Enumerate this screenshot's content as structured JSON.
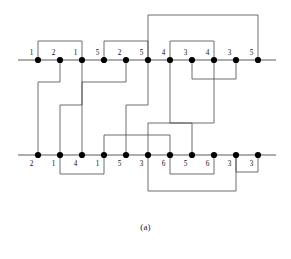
{
  "figure": {
    "caption": "(a)",
    "colors": {
      "axis_line": "#5b5b5b",
      "edge_line": "#4a4a4a",
      "node_fill": "#000000",
      "label_text": "#111111",
      "background": "#ffffff"
    },
    "geometry": {
      "node_spacing": 22,
      "first_node_x": 38,
      "top_row_y": 60,
      "bottom_row_y": 155,
      "node_radius": 3.1,
      "axis_left_x": 18,
      "axis_right_x": 276
    }
  },
  "chart_data": {
    "type": "diagram",
    "title": "(a)",
    "rows": [
      {
        "id": "top-row",
        "name": "top-strand",
        "y": 60,
        "label_position": "above",
        "labels": [
          "1",
          "2",
          "1",
          "5",
          "2",
          "5",
          "4",
          "3",
          "4",
          "3",
          "5"
        ],
        "x": [
          38,
          60,
          82,
          104,
          126,
          148,
          170,
          192,
          214,
          236,
          258
        ]
      },
      {
        "id": "bottom-row",
        "name": "bottom-strand",
        "y": 155,
        "label_position": "below",
        "labels": [
          "2",
          "1",
          "4",
          "1",
          "5",
          "3",
          "6",
          "5",
          "6",
          "3",
          "3"
        ],
        "x": [
          38,
          60,
          82,
          104,
          126,
          148,
          170,
          192,
          214,
          236,
          258
        ]
      }
    ],
    "edges": [
      {
        "id": "e1",
        "name": "top-arc-1-3",
        "kind": "arc-above-top",
        "from": {
          "row": "top",
          "index": 0
        },
        "to": {
          "row": "top",
          "index": 2
        },
        "apex_y": 41
      },
      {
        "id": "e2",
        "name": "top-arc-4-6",
        "kind": "arc-above-top",
        "from": {
          "row": "top",
          "index": 3
        },
        "to": {
          "row": "top",
          "index": 5
        },
        "apex_y": 41
      },
      {
        "id": "e3",
        "name": "top-arc-6-11",
        "kind": "arc-above-top",
        "from": {
          "row": "top",
          "index": 5
        },
        "to": {
          "row": "top",
          "index": 10
        },
        "apex_y": 15
      },
      {
        "id": "e4",
        "name": "top-arc-7-9",
        "kind": "arc-above-top",
        "from": {
          "row": "top",
          "index": 6
        },
        "to": {
          "row": "top",
          "index": 8
        },
        "apex_y": 41
      },
      {
        "id": "e5",
        "name": "top-arc-8-10",
        "kind": "arc-below-top",
        "from": {
          "row": "top",
          "index": 7
        },
        "to": {
          "row": "top",
          "index": 9
        },
        "apex_y": 79
      },
      {
        "id": "e6",
        "name": "cross-top2-bottom1",
        "kind": "cross",
        "from": {
          "row": "top",
          "index": 1
        },
        "to": {
          "row": "bottom",
          "index": 0
        },
        "mid_y": 82
      },
      {
        "id": "e7",
        "name": "cross-top5-bottom3",
        "kind": "cross",
        "from": {
          "row": "top",
          "index": 4
        },
        "to": {
          "row": "bottom",
          "index": 2
        },
        "mid_y": 82
      },
      {
        "id": "e8",
        "name": "cross-top3-bottom2",
        "kind": "cross",
        "from": {
          "row": "top",
          "index": 2
        },
        "to": {
          "row": "bottom",
          "index": 1
        },
        "mid_y": 105
      },
      {
        "id": "e9",
        "name": "cross-top6-bottom5",
        "kind": "cross",
        "from": {
          "row": "top",
          "index": 5
        },
        "to": {
          "row": "bottom",
          "index": 4
        },
        "mid_y": 105
      },
      {
        "id": "e10",
        "name": "cross-top7-bottom8",
        "kind": "cross",
        "from": {
          "row": "top",
          "index": 6
        },
        "to": {
          "row": "bottom",
          "index": 7
        },
        "mid_y": 123
      },
      {
        "id": "e11",
        "name": "cross-top9-bottom6",
        "kind": "cross",
        "from": {
          "row": "top",
          "index": 8
        },
        "to": {
          "row": "bottom",
          "index": 5
        },
        "mid_y": 123
      },
      {
        "id": "e12",
        "name": "cross-bottom4-bottom7",
        "kind": "cross-low",
        "from": {
          "row": "bottom",
          "index": 3
        },
        "to": {
          "row": "bottom",
          "index": 6
        },
        "mid_y": 135
      },
      {
        "id": "e13",
        "name": "bottom-arc-2-4",
        "kind": "arc-below-bottom",
        "from": {
          "row": "bottom",
          "index": 1
        },
        "to": {
          "row": "bottom",
          "index": 3
        },
        "apex_y": 174
      },
      {
        "id": "e14",
        "name": "bottom-arc-7-9",
        "kind": "arc-below-bottom",
        "from": {
          "row": "bottom",
          "index": 6
        },
        "to": {
          "row": "bottom",
          "index": 8
        },
        "apex_y": 174
      },
      {
        "id": "e15",
        "name": "bottom-arc-10-11",
        "kind": "arc-below-bottom",
        "from": {
          "row": "bottom",
          "index": 9
        },
        "to": {
          "row": "bottom",
          "index": 10
        },
        "apex_y": 172
      },
      {
        "id": "e16",
        "name": "bottom-arc-6-10",
        "kind": "arc-below-bottom",
        "from": {
          "row": "bottom",
          "index": 5
        },
        "to": {
          "row": "bottom",
          "index": 9
        },
        "apex_y": 191
      }
    ]
  }
}
